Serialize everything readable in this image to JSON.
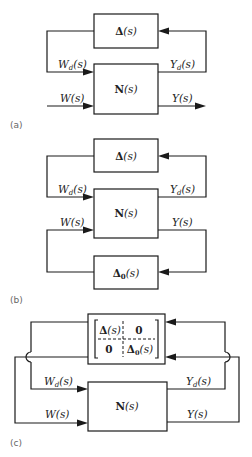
{
  "panels": {
    "a": {
      "caption": "(a)",
      "top_block": {
        "bold": "Δ",
        "rest": "(s)"
      },
      "main_block": {
        "bold": "N",
        "rest": "(s)"
      },
      "signals": {
        "wd": {
          "main": "W",
          "sub": "d",
          "rest": "(s)"
        },
        "yd": {
          "main": "Y",
          "sub": "d",
          "rest": "(s)"
        },
        "w": {
          "main": "W",
          "rest": "(s)"
        },
        "y": {
          "main": "Y",
          "rest": "(s)"
        }
      }
    },
    "b": {
      "caption": "(b)",
      "top_block": {
        "bold": "Δ",
        "rest": "(s)"
      },
      "main_block": {
        "bold": "N",
        "rest": "(s)"
      },
      "bottom_block": {
        "bold": "Δ",
        "sub": "0",
        "rest": "(s)"
      },
      "signals": {
        "wd": {
          "main": "W",
          "sub": "d",
          "rest": "(s)"
        },
        "yd": {
          "main": "Y",
          "sub": "d",
          "rest": "(s)"
        },
        "w": {
          "main": "W",
          "rest": "(s)"
        },
        "y": {
          "main": "Y",
          "rest": "(s)"
        }
      }
    },
    "c": {
      "caption": "(c)",
      "matrix_block": {
        "m11_bold": "Δ",
        "m11_rest": "(s)",
        "m12": "0",
        "m21": "0",
        "m22_bold": "Δ",
        "m22_sub": "0",
        "m22_rest": "(s)"
      },
      "main_block": {
        "bold": "N",
        "rest": "(s)"
      },
      "signals": {
        "wd": {
          "main": "W",
          "sub": "d",
          "rest": "(s)"
        },
        "yd": {
          "main": "Y",
          "sub": "d",
          "rest": "(s)"
        },
        "w": {
          "main": "W",
          "rest": "(s)"
        },
        "y": {
          "main": "Y",
          "rest": "(s)"
        }
      }
    }
  }
}
